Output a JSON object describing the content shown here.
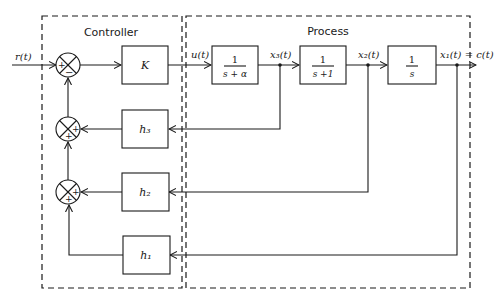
{
  "diagram": {
    "type": "block-diagram",
    "groups": {
      "controller": {
        "label": "Controller"
      },
      "process": {
        "label": "Process"
      }
    },
    "signals": {
      "input": "r(t)",
      "control": "u(t)",
      "x3": "x₃(t)",
      "x2": "x₂(t)",
      "output": "x₁(t) = c(t)"
    },
    "blocks": {
      "gain": "K",
      "tf1": {
        "num": "1",
        "den": "s + α"
      },
      "tf2": {
        "num": "1",
        "den": "s +1"
      },
      "tf3": {
        "num": "1",
        "den": "s"
      },
      "h3": "h₃",
      "h2": "h₂",
      "h1": "h₁"
    },
    "summing_junctions": {
      "sj1": {
        "signs": [
          "+",
          "−"
        ]
      },
      "sj2": {
        "signs": [
          "+",
          "+"
        ]
      },
      "sj3": {
        "signs": [
          "+",
          "+"
        ]
      }
    },
    "colors": {
      "ink": "#1a1a1a",
      "background": "#ffffff"
    }
  }
}
